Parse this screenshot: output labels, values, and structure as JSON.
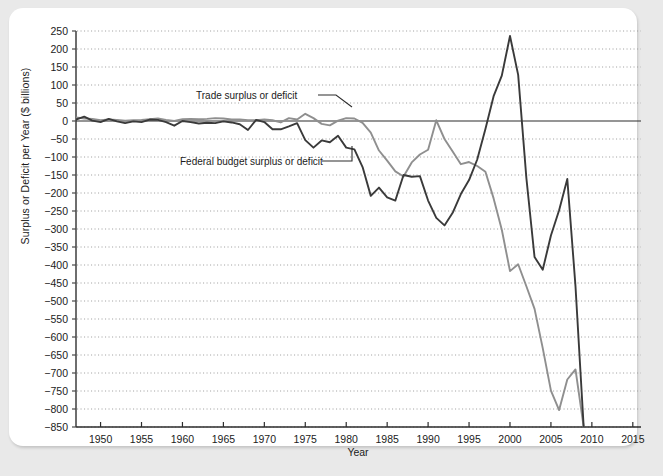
{
  "chart_data": {
    "type": "line",
    "title": "",
    "xlabel": "Year",
    "ylabel": "Surplus or Deficit per Year ($ billions)",
    "xlim": [
      1947,
      2016
    ],
    "ylim": [
      -850,
      250
    ],
    "ytick_step": 50,
    "xtick_step": 5,
    "grid": true,
    "legend_position": "inline-annotations",
    "xticks": [
      1950,
      1955,
      1960,
      1965,
      1970,
      1975,
      1980,
      1985,
      1990,
      1995,
      2000,
      2005,
      2010,
      2015
    ],
    "yticks": [
      250,
      200,
      150,
      100,
      50,
      0,
      -50,
      -100,
      -150,
      -200,
      -250,
      -300,
      -350,
      -400,
      -450,
      -500,
      -550,
      -600,
      -650,
      -700,
      -750,
      -800,
      -850
    ],
    "annotations": [
      {
        "text": "Trade surplus or deficit",
        "x": 1972,
        "y": 72
      },
      {
        "text": "Federal budget surplus or deficit",
        "x": 1968,
        "y": -148
      }
    ],
    "series": [
      {
        "name": "Trade surplus or deficit",
        "color": "#8f8f8f",
        "x": [
          1947,
          1948,
          1949,
          1950,
          1951,
          1952,
          1953,
          1954,
          1955,
          1956,
          1957,
          1958,
          1959,
          1960,
          1961,
          1962,
          1963,
          1964,
          1965,
          1966,
          1967,
          1968,
          1969,
          1970,
          1971,
          1972,
          1973,
          1974,
          1975,
          1976,
          1977,
          1978,
          1979,
          1980,
          1981,
          1982,
          1983,
          1984,
          1985,
          1986,
          1987,
          1988,
          1989,
          1990,
          1991,
          1992,
          1993,
          1994,
          1995,
          1996,
          1997,
          1998,
          1999,
          2000,
          2001,
          2002,
          2003,
          2004,
          2005,
          2006,
          2007,
          2008,
          2009
        ],
        "values": [
          10,
          7,
          6,
          2,
          4,
          3,
          1,
          2,
          3,
          5,
          7,
          3,
          0,
          5,
          6,
          5,
          6,
          8,
          7,
          4,
          4,
          2,
          2,
          4,
          2,
          -4,
          8,
          4,
          20,
          8,
          -8,
          -12,
          1,
          8,
          7,
          -5,
          -32,
          -82,
          -110,
          -140,
          -154,
          -115,
          -93,
          -80,
          2,
          -50,
          -85,
          -120,
          -114,
          -125,
          -141,
          -215,
          -302,
          -417,
          -398,
          -459,
          -522,
          -631,
          -749,
          -803,
          -718,
          -690,
          -850
        ]
      },
      {
        "name": "Federal budget surplus or deficit",
        "color": "#3a3a3a",
        "x": [
          1947,
          1948,
          1949,
          1950,
          1951,
          1952,
          1953,
          1954,
          1955,
          1956,
          1957,
          1958,
          1959,
          1960,
          1961,
          1962,
          1963,
          1964,
          1965,
          1966,
          1967,
          1968,
          1969,
          1970,
          1971,
          1972,
          1973,
          1974,
          1975,
          1976,
          1977,
          1978,
          1979,
          1980,
          1981,
          1982,
          1983,
          1984,
          1985,
          1986,
          1987,
          1988,
          1989,
          1990,
          1991,
          1992,
          1993,
          1994,
          1995,
          1996,
          1997,
          1998,
          1999,
          2000,
          2001,
          2002,
          2003,
          2004,
          2005,
          2006,
          2007,
          2008,
          2009
        ],
        "values": [
          4,
          12,
          1,
          -3,
          6,
          -1,
          -6,
          -1,
          -3,
          4,
          3,
          -3,
          -13,
          0,
          -3,
          -7,
          -5,
          -6,
          -1,
          -4,
          -9,
          -25,
          3,
          -3,
          -23,
          -23,
          -15,
          -6,
          -53,
          -74,
          -54,
          -59,
          -41,
          -74,
          -79,
          -128,
          -208,
          -185,
          -212,
          -221,
          -150,
          -155,
          -153,
          -221,
          -269,
          -290,
          -255,
          -203,
          -164,
          -107,
          -22,
          69,
          126,
          236,
          128,
          -158,
          -378,
          -413,
          -318,
          -248,
          -161,
          -459,
          -850
        ]
      }
    ]
  },
  "axis": {
    "x_title": "Year",
    "y_title": "Surplus or Deficit per Year ($ billions)"
  }
}
